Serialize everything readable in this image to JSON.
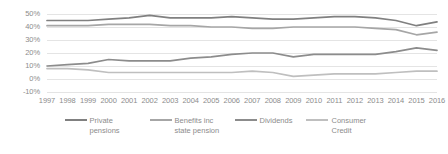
{
  "chart_data": {
    "type": "line",
    "title": "",
    "xlabel": "",
    "ylabel": "",
    "grid": true,
    "legend_position": "bottom",
    "ylim": [
      -10,
      50
    ],
    "yticks": [
      "50%",
      "40%",
      "30%",
      "20%",
      "10%",
      "0%",
      "-10%"
    ],
    "ytick_values": [
      50,
      40,
      30,
      20,
      10,
      0,
      -10
    ],
    "categories": [
      "1997",
      "1998",
      "1999",
      "2000",
      "2001",
      "2002",
      "2003",
      "2004",
      "2005",
      "2006",
      "2007",
      "2008",
      "2009",
      "2010",
      "2011",
      "2012",
      "2013",
      "2014",
      "2015",
      "2016"
    ],
    "series": [
      {
        "name": "Private pensions",
        "color": "#808080",
        "values": [
          45,
          45,
          45,
          46,
          47,
          49,
          47,
          47,
          47,
          48,
          47,
          46,
          46,
          47,
          48,
          48,
          47,
          45,
          41,
          44
        ]
      },
      {
        "name": "Benefits inc state pension",
        "color": "#a6a6a6",
        "values": [
          41,
          41,
          41,
          42,
          42,
          42,
          41,
          41,
          40,
          40,
          39,
          39,
          40,
          40,
          40,
          40,
          39,
          38,
          34,
          36
        ]
      },
      {
        "name": "Dividends",
        "color": "#8c8c8c",
        "values": [
          10,
          11,
          12,
          15,
          14,
          14,
          14,
          16,
          17,
          19,
          20,
          20,
          17,
          19,
          19,
          19,
          19,
          21,
          24,
          22
        ]
      },
      {
        "name": "Consumer Credit",
        "color": "#bfbfbf",
        "values": [
          8,
          8,
          7,
          5,
          5,
          5,
          5,
          5,
          5,
          5,
          6,
          5,
          2,
          3,
          4,
          4,
          4,
          5,
          6,
          6
        ]
      }
    ]
  },
  "legend": {
    "items": [
      {
        "label": "Private pensions",
        "color": "#808080",
        "swatch": "line-swatch"
      },
      {
        "label": "Benefits inc state pension",
        "color": "#a6a6a6",
        "swatch": "line-swatch"
      },
      {
        "label": "Dividends",
        "color": "#8c8c8c",
        "swatch": "line-swatch"
      },
      {
        "label": "Consumer Credit",
        "color": "#bfbfbf",
        "swatch": "line-swatch"
      }
    ]
  },
  "axes": {
    "grid_color": "#e4e4e4"
  }
}
